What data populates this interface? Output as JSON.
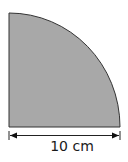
{
  "diagram": {
    "shape": "quarter-circle",
    "fill_color": "#a8a8a8",
    "stroke_color": "#333333",
    "dimension": {
      "label": "10 cm",
      "measures": "radius (horizontal edge)"
    }
  }
}
